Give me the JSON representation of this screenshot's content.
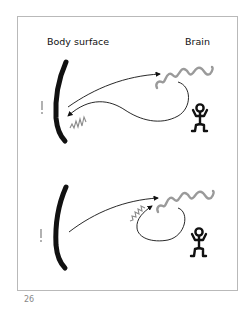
{
  "figure": {
    "labels": {
      "left": "Body surface",
      "right": "Brain"
    },
    "panels": [
      {
        "id": "top",
        "description": "Stimulus signal travels from body surface to brain; response loops back to body surface producing sensation at surface",
        "elements": [
          "body-surface-curve",
          "stimulus-mark",
          "afferent-arrow",
          "brain-wave",
          "efferent-loop-arrow",
          "surface-sensation-squiggle",
          "person-figure"
        ]
      },
      {
        "id": "bottom",
        "description": "Stimulus signal travels from body surface to brain; response loops back within brain producing sensation near brain",
        "elements": [
          "body-surface-curve",
          "stimulus-mark",
          "afferent-arrow",
          "brain-wave",
          "internal-loop-arrow",
          "brain-sensation-squiggle",
          "person-figure"
        ]
      }
    ],
    "colors": {
      "ink": "#111111",
      "wave": "#9a9a9a",
      "frame": "#b9b9b9",
      "page_number": "#888888"
    }
  },
  "page_number": "26"
}
